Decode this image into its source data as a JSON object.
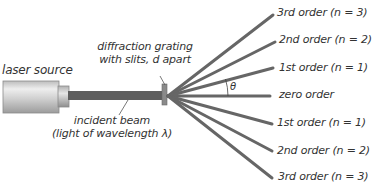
{
  "labels": {
    "laser_source": "laser source",
    "grating_line1": "diffraction grating",
    "grating_line2": "with slits, d apart",
    "beam_line1": "incident beam",
    "beam_line2": "(light of wavelength λ)",
    "theta": "θ"
  },
  "orders": [
    {
      "label": "3rd order (n = 3)",
      "end_x": 273,
      "end_y": 15
    },
    {
      "label": "2nd order (n = 2)",
      "end_x": 275,
      "end_y": 42
    },
    {
      "label": "1st order (n = 1)",
      "end_x": 273,
      "end_y": 68
    },
    {
      "label": "zero order",
      "end_x": 270,
      "end_y": 96
    },
    {
      "label": "1st order (n = 1)",
      "end_x": 272,
      "end_y": 124
    },
    {
      "label": "2nd order (n = 2)",
      "end_x": 272,
      "end_y": 151
    },
    {
      "label": "3rd order (n = 3)",
      "end_x": 272,
      "end_y": 178
    }
  ],
  "colors": {
    "beam": "#5e5e5e",
    "ray": "#666666",
    "text": "#333333",
    "laser_body": "#c8c8c8",
    "grating": "#8a8a8a"
  }
}
